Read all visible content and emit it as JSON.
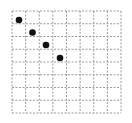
{
  "board": {
    "columns": 8,
    "rows": 8,
    "origin": [
      12,
      11
    ],
    "size": [
      109,
      102
    ],
    "grid_color": "#9a9a9a",
    "dot_color": "#111111",
    "dot_radius": 3.3
  },
  "pieces": [
    {
      "col": 0,
      "row": 0,
      "x": 19,
      "y": 20
    },
    {
      "col": 1,
      "row": 1,
      "x": 32.5,
      "y": 32.5
    },
    {
      "col": 2,
      "row": 2,
      "x": 46,
      "y": 45
    },
    {
      "col": 3,
      "row": 3,
      "x": 60,
      "y": 58
    }
  ]
}
